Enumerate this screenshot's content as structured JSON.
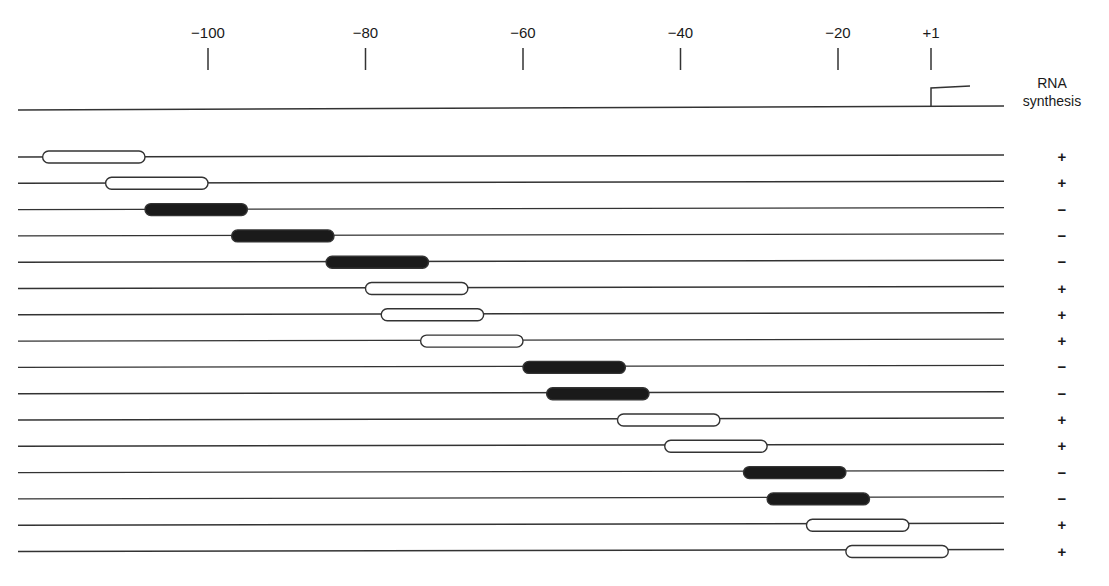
{
  "diagram": {
    "column_header": [
      "RNA",
      "synthesis"
    ],
    "axis": {
      "ticks": [
        {
          "label": "−100",
          "value": -100
        },
        {
          "label": "−80",
          "value": -80
        },
        {
          "label": "−60",
          "value": -60
        },
        {
          "label": "−40",
          "value": -40
        },
        {
          "label": "−20",
          "value": -20
        },
        {
          "label": "+1",
          "value": 1
        }
      ],
      "range": [
        -123,
        12
      ],
      "transcription_start": 1
    },
    "rows": [
      {
        "start": -121,
        "end": -108,
        "filled": false,
        "rna_synthesis": "+"
      },
      {
        "start": -113,
        "end": -100,
        "filled": false,
        "rna_synthesis": "+"
      },
      {
        "start": -108,
        "end": -95,
        "filled": true,
        "rna_synthesis": "−"
      },
      {
        "start": -97,
        "end": -84,
        "filled": true,
        "rna_synthesis": "−"
      },
      {
        "start": -85,
        "end": -72,
        "filled": true,
        "rna_synthesis": "−"
      },
      {
        "start": -80,
        "end": -67,
        "filled": false,
        "rna_synthesis": "+"
      },
      {
        "start": -78,
        "end": -65,
        "filled": false,
        "rna_synthesis": "+"
      },
      {
        "start": -73,
        "end": -60,
        "filled": false,
        "rna_synthesis": "+"
      },
      {
        "start": -60,
        "end": -47,
        "filled": true,
        "rna_synthesis": "−"
      },
      {
        "start": -57,
        "end": -44,
        "filled": true,
        "rna_synthesis": "−"
      },
      {
        "start": -48,
        "end": -35,
        "filled": false,
        "rna_synthesis": "+"
      },
      {
        "start": -42,
        "end": -29,
        "filled": false,
        "rna_synthesis": "+"
      },
      {
        "start": -32,
        "end": -19,
        "filled": true,
        "rna_synthesis": "−"
      },
      {
        "start": -29,
        "end": -16,
        "filled": true,
        "rna_synthesis": "−"
      },
      {
        "start": -24,
        "end": -11,
        "filled": false,
        "rna_synthesis": "+"
      },
      {
        "start": -19,
        "end": -6,
        "filled": false,
        "rna_synthesis": "+"
      }
    ],
    "legend": {
      "filled_meaning": "mutated region abolishes RNA synthesis",
      "open_meaning": "mutated region does not affect RNA synthesis"
    }
  }
}
